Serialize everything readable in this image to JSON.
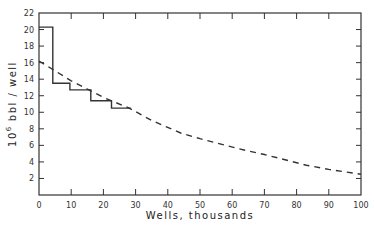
{
  "chart_data": {
    "type": "line",
    "title": "",
    "xlabel": "Wells, thousands",
    "ylabel": "10^6 bbl / well",
    "ylabel_parts": {
      "exponent_base": "10",
      "exponent": "6",
      "text": "bbl / well"
    },
    "xlim": [
      0,
      100
    ],
    "ylim": [
      0,
      22
    ],
    "x_ticks": [
      0,
      10,
      20,
      30,
      40,
      50,
      60,
      70,
      80,
      90,
      100
    ],
    "y_ticks": [
      2,
      4,
      6,
      8,
      10,
      12,
      14,
      16,
      18,
      20,
      22
    ],
    "grid": false,
    "legend": null,
    "series": [
      {
        "name": "historical (step)",
        "style": "solid-step",
        "x": [
          0,
          4.3,
          4.3,
          9.6,
          9.6,
          16.1,
          16.1,
          22.5,
          22.5,
          28.5
        ],
        "y": [
          20.3,
          20.3,
          13.5,
          13.5,
          12.7,
          12.7,
          11.4,
          11.4,
          10.5,
          10.5
        ]
      },
      {
        "name": "projection (dashed)",
        "style": "dashed",
        "x": [
          0,
          5,
          10,
          15,
          20,
          28,
          35,
          44,
          50,
          64,
          70,
          83,
          90,
          100
        ],
        "y": [
          16.2,
          15.0,
          13.8,
          12.8,
          11.8,
          10.5,
          9.0,
          7.5,
          6.8,
          5.4,
          4.9,
          3.6,
          3.1,
          2.5
        ]
      }
    ]
  }
}
